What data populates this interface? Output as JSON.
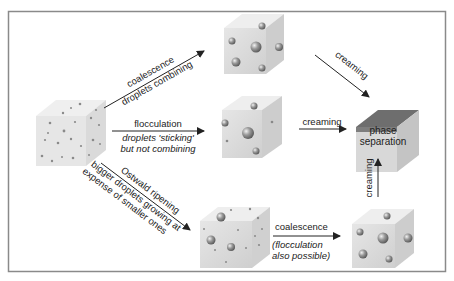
{
  "colors": {
    "frame": "#8a8a8a",
    "cube_front": "#dcdcdc",
    "cube_top": "#ececec",
    "cube_side": "#c4c4c4",
    "separated_top": "#6e6e6e",
    "arrow": "#222222",
    "droplet": "#8c8c8c"
  },
  "nodes": {
    "initial": {
      "label": ""
    },
    "coalesced": {
      "label": ""
    },
    "flocculated": {
      "label": ""
    },
    "ripened": {
      "label": ""
    },
    "ripened_coalesced": {
      "label": ""
    },
    "separated": {
      "label_line1": "phase",
      "label_line2": "separation"
    }
  },
  "arrows": {
    "coalescence_top": {
      "label": "coalescence",
      "sublabel": "droplets combining"
    },
    "flocculation": {
      "label": "flocculation",
      "sublabel_line1": "droplets 'sticking'",
      "sublabel_line2": "but not combining"
    },
    "ostwald": {
      "label": "Ostwald ripening",
      "sublabel_line1": "bigger droplets growing at",
      "sublabel_line2": "expense of smaller ones"
    },
    "creaming_top": {
      "label": "creaming"
    },
    "creaming_mid": {
      "label": "creaming"
    },
    "creaming_up": {
      "label": "creaming"
    },
    "coalescence_bottom": {
      "label": "coalescence",
      "sublabel_line1": "(flocculation",
      "sublabel_line2": "also possible)"
    }
  }
}
